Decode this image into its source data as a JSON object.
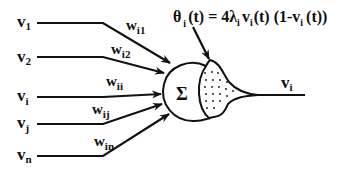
{
  "diagram": {
    "type": "artificial-neuron",
    "inputs": [
      {
        "base": "v",
        "sub": "1",
        "weight_base": "w",
        "weight_sub": "i1"
      },
      {
        "base": "v",
        "sub": "2",
        "weight_base": "w",
        "weight_sub": "i2"
      },
      {
        "base": "v",
        "sub": "i",
        "weight_base": "w",
        "weight_sub": "ii"
      },
      {
        "base": "v",
        "sub": "j",
        "weight_base": "w",
        "weight_sub": "ij"
      },
      {
        "base": "v",
        "sub": "n",
        "weight_base": "w",
        "weight_sub": "in"
      }
    ],
    "summation_symbol": "Σ",
    "output": {
      "base": "v",
      "sub": "i"
    },
    "threshold_equation": {
      "theta": "θ",
      "theta_sub": "i",
      "lhs_rest": "(t) = 4λ",
      "lambda_sub": "i",
      "v1": "v",
      "v1_sub": "i",
      "mid": "(t) (1-v",
      "v2_sub": "i",
      "end": "(t))"
    },
    "colors": {
      "stroke": "#111111",
      "background": "#ffffff"
    }
  }
}
